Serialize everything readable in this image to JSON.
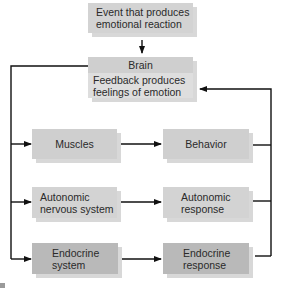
{
  "diagram": {
    "nodes": {
      "event": {
        "line1": "Event that produces",
        "line2": "emotional reaction"
      },
      "brain": {
        "title": "Brain",
        "line1": "Feedback produces",
        "line2": "feelings of emotion"
      },
      "muscles": {
        "label": "Muscles"
      },
      "behavior": {
        "label": "Behavior"
      },
      "autonomic_ns": {
        "line1": "Autonomic",
        "line2": "nervous system"
      },
      "autonomic_response": {
        "line1": "Autonomic",
        "line2": "response"
      },
      "endocrine_system": {
        "line1": "Endocrine",
        "line2": "system"
      },
      "endocrine_response": {
        "line1": "Endocrine",
        "line2": "response"
      }
    },
    "edges": [
      {
        "from": "Event that produces emotional reaction",
        "to": "Brain"
      },
      {
        "from": "Brain",
        "to": "Muscles"
      },
      {
        "from": "Brain",
        "to": "Autonomic nervous system"
      },
      {
        "from": "Brain",
        "to": "Endocrine system"
      },
      {
        "from": "Muscles",
        "to": "Behavior"
      },
      {
        "from": "Autonomic nervous system",
        "to": "Autonomic response"
      },
      {
        "from": "Endocrine system",
        "to": "Endocrine response"
      },
      {
        "from": "Behavior",
        "to": "Brain (feedback)"
      },
      {
        "from": "Autonomic response",
        "to": "Brain (feedback)"
      },
      {
        "from": "Endocrine response",
        "to": "Brain (feedback)"
      }
    ],
    "colors": {
      "light_box": "#d3d3d3",
      "dark_box": "#b9b9b9",
      "line": "#111111"
    }
  }
}
